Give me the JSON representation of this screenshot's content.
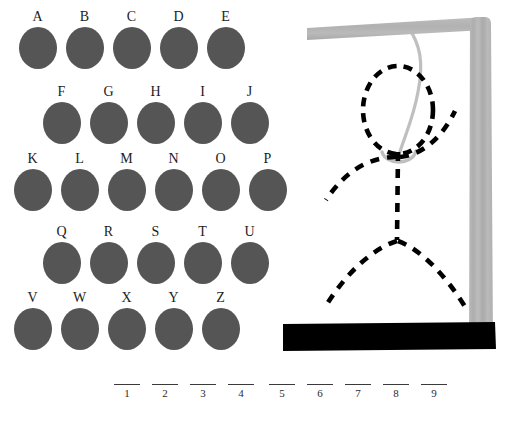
{
  "game": {
    "title": "Hangman",
    "alphabet_rows": [
      {
        "row_index": 0,
        "left": 14,
        "top": 10,
        "letters": [
          "A",
          "B",
          "C",
          "D",
          "E"
        ]
      },
      {
        "row_index": 1,
        "left": 38,
        "top": 85,
        "letters": [
          "F",
          "G",
          "H",
          "I",
          "J"
        ]
      },
      {
        "row_index": 2,
        "left": 9,
        "top": 152,
        "letters": [
          "K",
          "L",
          "M",
          "N",
          "O",
          "P"
        ]
      },
      {
        "row_index": 3,
        "left": 38,
        "top": 225,
        "letters": [
          "Q",
          "R",
          "S",
          "T",
          "U"
        ]
      },
      {
        "row_index": 4,
        "left": 9,
        "top": 291,
        "letters": [
          "V",
          "W",
          "X",
          "Y",
          "Z"
        ]
      }
    ],
    "word_groups": [
      {
        "group_index": 0,
        "slots": [
          "1",
          "2",
          "3",
          "4"
        ],
        "values": [
          "",
          "",
          "",
          ""
        ]
      },
      {
        "group_index": 1,
        "slots": [
          "5",
          "6",
          "7",
          "8",
          "9"
        ],
        "values": [
          "",
          "",
          "",
          "",
          ""
        ]
      }
    ],
    "figure": {
      "parts_drawn": [
        "head",
        "body",
        "left-arm",
        "right-arm",
        "left-leg",
        "right-leg"
      ],
      "parts_count": 6,
      "style": "dashed-outline"
    },
    "colors": {
      "background": "#ffffff",
      "letter_disc": "#555555",
      "letter_text": "#1c1c1c",
      "gallows_wood": "#b5b5b5",
      "gallows_wood_shade": "#a8a8a8",
      "rope": "#bdbdbd",
      "ground": "#000000",
      "figure_stroke": "#000000",
      "blank_line": "#3a3a3a"
    }
  }
}
